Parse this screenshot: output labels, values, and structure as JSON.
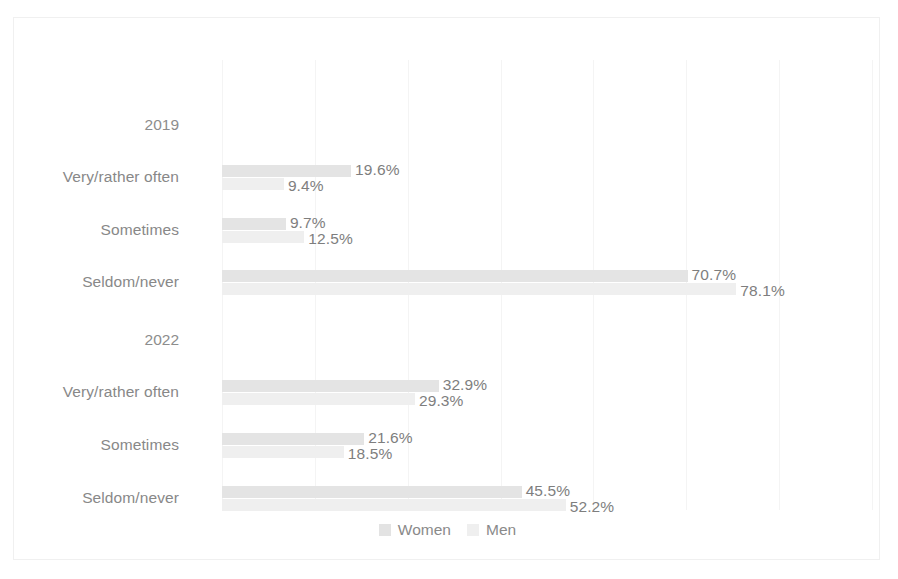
{
  "chart_data": {
    "type": "bar",
    "orientation": "horizontal",
    "title": "",
    "subtitle": "",
    "xlabel": "",
    "ylabel": "",
    "grid": true,
    "legend_position": "bottom",
    "xlim": [
      0,
      98.7
    ],
    "gridline_values": [
      0,
      14.1,
      28.2,
      42.3,
      56.4,
      70.5,
      84.6,
      98.7
    ],
    "group_labels": [
      "2019",
      "2022"
    ],
    "categories": [
      "Very/rather often",
      "Sometimes",
      "Seldom/never"
    ],
    "series": [
      {
        "name": "Women",
        "color": "#e3e3e3",
        "groups": [
          {
            "group": "2019",
            "values": [
              19.6,
              9.7,
              70.7
            ]
          },
          {
            "group": "2022",
            "values": [
              32.9,
              21.6,
              45.5
            ]
          }
        ]
      },
      {
        "name": "Men",
        "color": "#eeeeee",
        "groups": [
          {
            "group": "2019",
            "values": [
              9.4,
              12.5,
              78.1
            ]
          },
          {
            "group": "2022",
            "values": [
              29.3,
              18.5,
              52.2
            ]
          }
        ]
      }
    ],
    "data_labels": [
      "19.6%",
      "9.4%",
      "9.7%",
      "12.5%",
      "70.7%",
      "78.1%",
      "32.9%",
      "29.3%",
      "21.6%",
      "18.5%",
      "45.5%",
      "52.2%"
    ]
  },
  "rows": [
    {
      "id": "g2019",
      "kind": "group",
      "label": "2019",
      "y": 66
    },
    {
      "id": "r2019a",
      "kind": "category",
      "label": "Very/rather often",
      "y": 118,
      "women": {
        "value": 19.6,
        "label": "19.6%"
      },
      "men": {
        "value": 9.4,
        "label": "9.4%"
      }
    },
    {
      "id": "r2019b",
      "kind": "category",
      "label": "Sometimes",
      "y": 171,
      "women": {
        "value": 9.7,
        "label": "9.7%"
      },
      "men": {
        "value": 12.5,
        "label": "12.5%"
      }
    },
    {
      "id": "r2019c",
      "kind": "category",
      "label": "Seldom/never",
      "y": 223,
      "women": {
        "value": 70.7,
        "label": "70.7%"
      },
      "men": {
        "value": 78.1,
        "label": "78.1%"
      }
    },
    {
      "id": "g2022",
      "kind": "group",
      "label": "2022",
      "y": 281
    },
    {
      "id": "r2022a",
      "kind": "category",
      "label": "Very/rather often",
      "y": 333,
      "women": {
        "value": 32.9,
        "label": "32.9%"
      },
      "men": {
        "value": 29.3,
        "label": "29.3%"
      }
    },
    {
      "id": "r2022b",
      "kind": "category",
      "label": "Sometimes",
      "y": 386,
      "women": {
        "value": 21.6,
        "label": "21.6%"
      },
      "men": {
        "value": 18.5,
        "label": "18.5%"
      }
    },
    {
      "id": "r2022c",
      "kind": "category",
      "label": "Seldom/never",
      "y": 439,
      "women": {
        "value": 45.5,
        "label": "45.5%"
      },
      "men": {
        "value": 52.2,
        "label": "52.2%"
      }
    }
  ],
  "legend": {
    "items": [
      {
        "label": "Women",
        "color": "#e3e3e3"
      },
      {
        "label": "Men",
        "color": "#efefef"
      }
    ]
  },
  "colors": {
    "women_bar": "#e4e4e4",
    "men_bar": "#efefef",
    "gridline": "#f4f4f4",
    "frame": "#f0f0f0",
    "label_text": "#888888",
    "value_text": "#7e7e7e"
  }
}
